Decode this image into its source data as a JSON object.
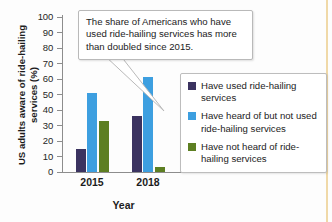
{
  "chart_data": {
    "type": "bar",
    "title": "",
    "xlabel": "Year",
    "ylabel": "US adults aware of ride-hailing services (%)",
    "categories": [
      "2015",
      "2018"
    ],
    "ylim": [
      0,
      100
    ],
    "y_ticks": [
      0,
      10,
      20,
      30,
      40,
      50,
      60,
      70,
      80,
      90,
      100
    ],
    "y_tick_labels": [
      "0",
      "10",
      "20",
      "30",
      "40",
      "50",
      "60",
      "70",
      "80",
      "90",
      "100"
    ],
    "grid": false,
    "legend_position": "right",
    "series": [
      {
        "name": "Have used ride-hailing services",
        "color": "#3b3360",
        "values": [
          15,
          36
        ]
      },
      {
        "name": "Have heard of but not used ride-hailing services",
        "color": "#3d9fe0",
        "values": [
          51,
          61
        ]
      },
      {
        "name": "Have not heard of ride-hailing services",
        "color": "#5d7f22",
        "values": [
          33,
          3
        ]
      }
    ],
    "annotations": [
      {
        "text": "The share of Americans who have used ride-hailing services has more than doubled since 2015.",
        "points_to": "2015-have-used-bar"
      }
    ]
  },
  "axes": {
    "y_title": "US adults aware of ride-hailing services (%)",
    "x_title": "Year"
  },
  "legend": {
    "items": [
      {
        "label": "Have used ride-hailing services",
        "color": "#3b3360"
      },
      {
        "label": "Have heard of but not used ride-hailing services",
        "color": "#3d9fe0"
      },
      {
        "label": "Have not heard of ride-hailing services",
        "color": "#5d7f22"
      }
    ]
  },
  "callout": {
    "text": "The share of Americans who have used ride-hailing services has more than doubled since 2015."
  }
}
